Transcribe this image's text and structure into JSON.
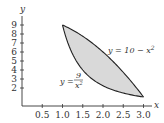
{
  "chart_data": {
    "type": "area",
    "title": "",
    "xlabel": "x",
    "ylabel": "y",
    "xlim": [
      0,
      3.2
    ],
    "ylim": [
      0,
      10
    ],
    "grid": false,
    "x_ticks": [
      0.5,
      1.0,
      1.5,
      2.0,
      2.5,
      3.0
    ],
    "x_tick_labels": [
      "0.5",
      "1.0",
      "1.5",
      "2.0",
      "2.5",
      "3.0"
    ],
    "y_ticks": [
      2,
      3,
      4,
      5,
      6,
      7,
      8,
      9
    ],
    "y_tick_labels": [
      "2",
      "3",
      "4",
      "5",
      "6",
      "7",
      "8",
      "9"
    ],
    "series": [
      {
        "name": "y = 10 − x²",
        "equation": "y = 10 - x^2",
        "x": [
          1.0,
          1.5,
          2.0,
          2.5,
          3.0
        ],
        "values": [
          9,
          7.75,
          6,
          3.75,
          1
        ]
      },
      {
        "name": "y = 9/x²",
        "equation": "y = 9/x^2",
        "x": [
          1.0,
          1.5,
          2.0,
          2.5,
          3.0
        ],
        "values": [
          9,
          4,
          2.25,
          1.44,
          1
        ]
      }
    ],
    "shaded_region": {
      "between": [
        "y = 10 - x^2",
        "y = 9/x^2"
      ],
      "x_range": [
        1,
        3
      ],
      "color": "#d9d9d9"
    },
    "intersections": [
      [
        1,
        9
      ],
      [
        3,
        1
      ]
    ],
    "annotations": [
      {
        "text": "y = 10 − x²",
        "near_x": 2.3,
        "near_y": 6
      },
      {
        "text": "y = 9/x²",
        "near_x": 1.1,
        "near_y": 3
      }
    ]
  },
  "labels": {
    "x_axis": "x",
    "y_axis": "y",
    "upper_curve": {
      "prefix": "y = 10 − x",
      "exp": "2"
    },
    "lower_curve": {
      "prefix": "y =",
      "num": "9",
      "den": "x",
      "exp": "2"
    }
  }
}
